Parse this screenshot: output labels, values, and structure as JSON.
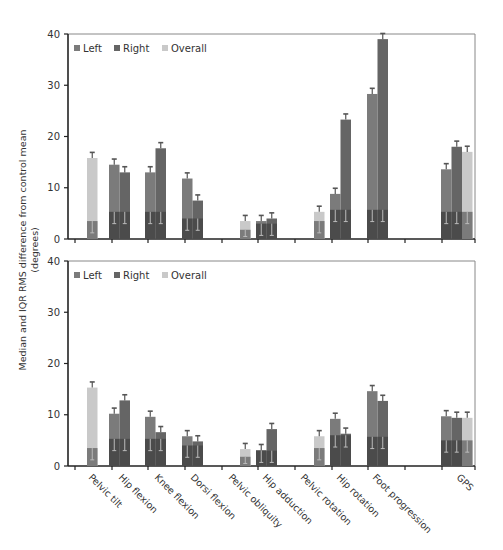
{
  "chart_data": [
    {
      "type": "bar",
      "title": "",
      "ylabel": "Median and IQR RMS difference from control mean (degrees)",
      "xlabel": "",
      "ylim": [
        0,
        40
      ],
      "yticks": [
        0,
        10,
        20,
        30,
        40
      ],
      "legend": [
        "Left",
        "Right",
        "Overall"
      ],
      "legend_position": "top-left",
      "grid": false,
      "categories": [
        "Pelvic tilt",
        "Hip flexion",
        "Knee flexion",
        "Dorsi flexion",
        "Pelvic obliquity",
        "Hip adduction",
        "Pelvic rotation",
        "Hip rotation",
        "Foot progression",
        "GPS"
      ],
      "series": [
        {
          "name": "Left",
          "values": [
            null,
            14.5,
            13.0,
            11.8,
            null,
            3.5,
            null,
            8.8,
            28.3,
            13.6
          ]
        },
        {
          "name": "Right",
          "values": [
            null,
            13.0,
            17.7,
            7.5,
            null,
            4.0,
            null,
            23.3,
            39.0,
            18.0
          ]
        },
        {
          "name": "Overall",
          "values": [
            15.8,
            null,
            null,
            null,
            3.5,
            null,
            5.3,
            null,
            null,
            17.0
          ]
        }
      ],
      "lower_quartile": [
        3.5,
        5.3,
        5.3,
        4.0,
        1.8,
        3.0,
        3.5,
        5.7,
        5.7,
        5.3
      ]
    },
    {
      "type": "bar",
      "title": "",
      "ylabel": "Median and IQR RMS difference from control mean (degrees)",
      "xlabel": "",
      "ylim": [
        0,
        40
      ],
      "yticks": [
        0,
        10,
        20,
        30,
        40
      ],
      "legend": [
        "Left",
        "Right",
        "Overall"
      ],
      "legend_position": "top-left",
      "grid": false,
      "categories": [
        "Pelvic tilt",
        "Hip flexion",
        "Knee flexion",
        "Dorsi flexion",
        "Pelvic obliquity",
        "Hip adduction",
        "Pelvic rotation",
        "Hip rotation",
        "Foot progression",
        "GPS"
      ],
      "series": [
        {
          "name": "Left",
          "values": [
            null,
            10.2,
            9.6,
            5.8,
            null,
            3.1,
            null,
            9.2,
            14.6,
            9.7
          ]
        },
        {
          "name": "Right",
          "values": [
            null,
            12.8,
            6.6,
            4.8,
            null,
            7.2,
            null,
            6.3,
            12.7,
            9.4
          ]
        },
        {
          "name": "Overall",
          "values": [
            15.3,
            null,
            null,
            null,
            3.3,
            null,
            5.8,
            null,
            null,
            9.4
          ]
        }
      ],
      "lower_quartile": [
        3.5,
        5.3,
        5.3,
        4.0,
        1.8,
        3.0,
        3.5,
        6.0,
        5.7,
        5.0
      ]
    }
  ],
  "axis_title": {
    "line1": "Median and IQR RMS difference from control mean",
    "line2": "(degrees)"
  },
  "legend": {
    "left": "Left",
    "right": "Right",
    "overall": "Overall"
  },
  "colors": {
    "left": "#7b7b7b",
    "right": "#656565",
    "overall": "#c9c9c9",
    "iqr": "#4b4b4b",
    "iqr_overall_lower": "#7b7b7b",
    "axis": "#222222"
  }
}
